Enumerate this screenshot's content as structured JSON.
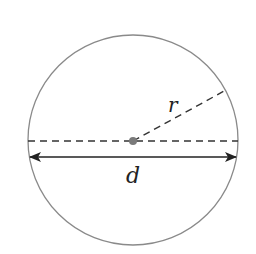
{
  "diagram": {
    "type": "circle-geometry",
    "circle": {
      "cx": 133,
      "cy": 140,
      "r": 105,
      "stroke": "#8a8a8a"
    },
    "center_point": {
      "cx": 133,
      "cy": 141,
      "r": 4,
      "fill": "#7a7a7a"
    },
    "diameter_dashed": {
      "x1": 28,
      "y1": 141,
      "x2": 238,
      "y2": 141,
      "stroke": "#333333"
    },
    "radius_dashed": {
      "x1": 133,
      "y1": 141,
      "x2": 226,
      "y2": 90,
      "stroke": "#333333"
    },
    "diameter_arrow": {
      "x1": 30,
      "y1": 157,
      "x2": 236,
      "y2": 157,
      "stroke": "#222222"
    },
    "labels": {
      "radius": "r",
      "diameter": "d"
    }
  }
}
